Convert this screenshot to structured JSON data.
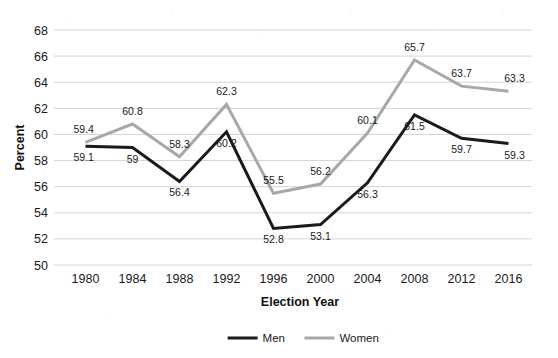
{
  "chart_data": {
    "type": "line",
    "title": "",
    "xlabel": "Election Year",
    "ylabel": "Percent",
    "categories": [
      "1980",
      "1984",
      "1988",
      "1992",
      "1996",
      "2000",
      "2004",
      "2008",
      "2012",
      "2016"
    ],
    "series": [
      {
        "name": "Men",
        "color": "#1a1a1a",
        "values": [
          59.1,
          59,
          56.4,
          60.2,
          52.8,
          53.1,
          56.3,
          61.5,
          59.7,
          59.3
        ],
        "labels": [
          "59.1",
          "59",
          "56.4",
          "60.2",
          "52.8",
          "53.1",
          "56.3",
          "61.5",
          "59.7",
          "59.3"
        ],
        "label_positions": [
          "below",
          "below",
          "below",
          "below",
          "below",
          "below",
          "below",
          "below",
          "below",
          "below"
        ]
      },
      {
        "name": "Women",
        "color": "#a8a8a8",
        "values": [
          59.4,
          60.8,
          58.3,
          62.3,
          55.5,
          56.2,
          60.1,
          65.7,
          63.7,
          63.3
        ],
        "labels": [
          "59.4",
          "60.8",
          "58.3",
          "62.3",
          "55.5",
          "56.2",
          "60.1",
          "65.7",
          "63.7",
          "63.3"
        ],
        "label_positions": [
          "above",
          "above",
          "above",
          "above",
          "above",
          "above",
          "above",
          "above",
          "above",
          "above"
        ]
      }
    ],
    "ylim": [
      50,
      68
    ],
    "yticks": [
      50,
      52,
      54,
      56,
      58,
      60,
      62,
      64,
      66,
      68
    ],
    "ytick_labels": [
      "50",
      "52",
      "54",
      "56",
      "58",
      "60",
      "62",
      "64",
      "66",
      "68"
    ],
    "grid": "horizontal",
    "grid_color": "#d4d4d4",
    "legend_position": "bottom-center",
    "legend": [
      "Men",
      "Women"
    ],
    "background": "#ffffff"
  }
}
